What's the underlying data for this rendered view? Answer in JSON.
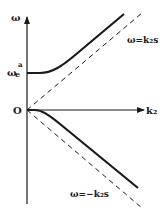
{
  "diagram": {
    "type": "dispersion-relation",
    "axes": {
      "y_label": "ω",
      "x_label": "k₂",
      "origin_label": "O"
    },
    "y_intercept_label": {
      "base": "ω",
      "subscript": "e",
      "superscript": "a"
    },
    "asymptotes": [
      {
        "label": "ω=k₂s",
        "style": "dashed",
        "direction": "positive"
      },
      {
        "label": "ω=−k₂s",
        "style": "dashed",
        "direction": "negative"
      }
    ],
    "curves": [
      {
        "name": "upper-branch",
        "style": "solid",
        "starts_at": "ωe^a",
        "approaches": "ω=k₂s"
      },
      {
        "name": "lower-branch",
        "style": "solid",
        "starts_at": "O",
        "approaches": "ω=−k₂s"
      }
    ],
    "colors": {
      "line": "#1a1a1a",
      "background": "#ffffff"
    }
  }
}
